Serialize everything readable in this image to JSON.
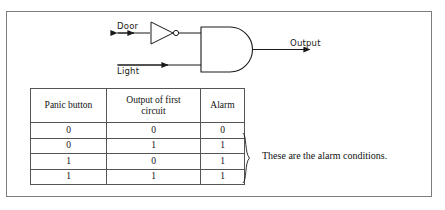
{
  "figure": {
    "background": "#ffffff",
    "frame_color": "#7d7d7d",
    "ink_color": "#1a1a1a"
  },
  "circuit": {
    "inputs": [
      {
        "name": "door-input",
        "label": "Door"
      },
      {
        "name": "light-input",
        "label": "Light"
      }
    ],
    "gates": [
      {
        "name": "not-gate",
        "type": "NOT",
        "inputs": [
          "Door"
        ]
      },
      {
        "name": "and-gate",
        "type": "AND",
        "inputs": [
          "NOT(Door)",
          "Light"
        ]
      }
    ],
    "output": {
      "name": "circuit-output",
      "label": "Output"
    }
  },
  "table": {
    "headers": [
      "Panic button",
      "Output of first circuit",
      "Alarm"
    ],
    "header_lines": [
      [
        "Panic button"
      ],
      [
        "Output of first",
        "circuit"
      ],
      [
        "Alarm"
      ]
    ],
    "rows": [
      [
        "0",
        "0",
        "0"
      ],
      [
        "0",
        "1",
        "1"
      ],
      [
        "1",
        "0",
        "1"
      ],
      [
        "1",
        "1",
        "1"
      ]
    ]
  },
  "annotation": {
    "brace_rows": [
      2,
      3,
      4
    ],
    "text": "These are the alarm conditions."
  }
}
